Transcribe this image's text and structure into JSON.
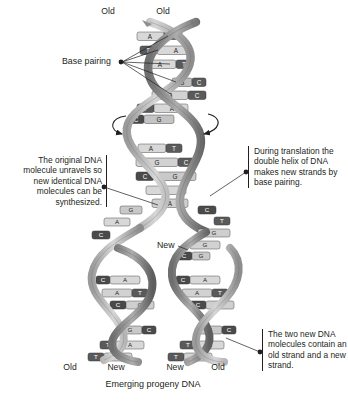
{
  "figure": {
    "caption": "Emerging progeny DNA",
    "colors": {
      "ink": "#231f20",
      "backbone_light": "#c9c9c9",
      "backbone_mid": "#a8a8a8",
      "backbone_dark": "#6e6e6e",
      "base_light": "#d8d8d8",
      "base_dark": "#5a5a5a",
      "outline": "#4d4d4d"
    }
  },
  "labels": {
    "old_top_left": "Old",
    "old_top_right": "Old",
    "base_pairing": "Base pairing",
    "new_fork": "New",
    "old_bottom_left": "Old",
    "new_bottom_left": "New",
    "new_bottom_right": "New",
    "old_bottom_right": "Old"
  },
  "annotations": {
    "left": "The original DNA molecule unravels so new identical DNA molecules can be synthesized.",
    "right_top": "During translation the double helix of DNA makes new strands by base pairing.",
    "right_bottom": "The two new DNA molecules contain an old strand and a new strand."
  },
  "helix": {
    "parent_base_pairs": [
      {
        "left": "A",
        "right": "T"
      },
      {
        "left": "T",
        "right": "A"
      },
      {
        "left": "A",
        "right": "T"
      },
      {
        "left": "G",
        "right": "C"
      },
      {
        "left": "G",
        "right": "C"
      },
      {
        "left": "T",
        "right": "A"
      },
      {
        "left": "C",
        "right": "G"
      },
      {
        "left": "A",
        "right": "T"
      },
      {
        "left": "G",
        "right": "C"
      },
      {
        "left": "C",
        "right": "G"
      },
      {
        "left": "A",
        "right": "T"
      }
    ],
    "fork_bases_left": [
      "G",
      "A",
      "C"
    ],
    "fork_bases_right": [
      "C",
      "T",
      "G",
      "G",
      "C"
    ],
    "daughter_left_pairs": [
      {
        "left": "C",
        "right": "A"
      },
      {
        "left": "A",
        "right": "T"
      },
      {
        "left": "C",
        "right": "G"
      },
      {
        "left": "G",
        "right": "C"
      },
      {
        "left": "T",
        "right": "A"
      },
      {
        "left": "T",
        "right": "A"
      }
    ],
    "daughter_right_pairs": [
      {
        "left": "C",
        "right": "A"
      },
      {
        "left": "A",
        "right": "T"
      },
      {
        "left": "C",
        "right": "G"
      },
      {
        "left": "G",
        "right": "C"
      },
      {
        "left": "T",
        "right": "A"
      },
      {
        "left": "T",
        "right": "A"
      }
    ]
  }
}
